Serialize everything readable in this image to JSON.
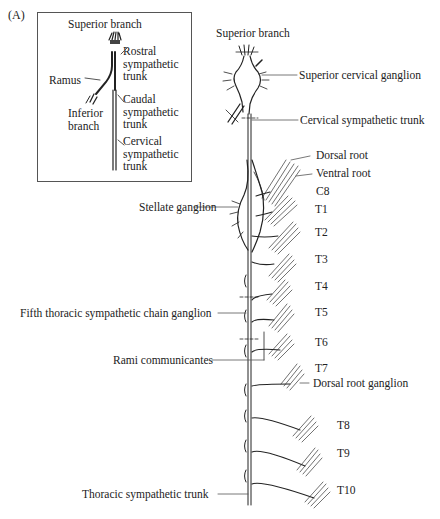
{
  "panel_label": "(A)",
  "inset": {
    "superior_branch": "Superior branch",
    "rostral": [
      "Rostral",
      "sympathetic",
      "trunk"
    ],
    "ramus": "Ramus",
    "caudal": [
      "Caudal",
      "sympathetic",
      "trunk"
    ],
    "inferior": [
      "Inferior",
      "branch"
    ],
    "cervical": [
      "Cervical",
      "sympathetic",
      "trunk"
    ]
  },
  "main": {
    "superior_branch": "Superior branch",
    "superior_cervical_ganglion": "Superior cervical ganglion",
    "cervical_sympathetic_trunk": "Cervical sympathetic trunk",
    "dorsal_root": "Dorsal root",
    "ventral_root": "Ventral root",
    "stellate_ganglion": "Stellate ganglion",
    "fifth_thoracic": "Fifth thoracic sympathetic chain ganglion",
    "rami_communicantes": "Rami communicantes",
    "dorsal_root_ganglion": "Dorsal root ganglion",
    "thoracic_sympathetic_trunk": "Thoracic sympathetic trunk",
    "segments": [
      "C8",
      "T1",
      "T2",
      "T3",
      "T4",
      "T5",
      "T6",
      "T7",
      "T8",
      "T9",
      "T10"
    ]
  }
}
